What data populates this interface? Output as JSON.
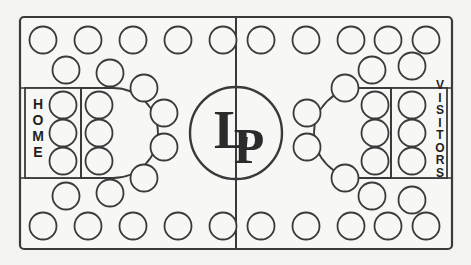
{
  "diagram": {
    "type": "rink-seating-map",
    "background_color": "#f3f3f1",
    "line_color": "#3a3a3a",
    "circle_fill": "#f7f7f5"
  },
  "center_logo": {
    "name": "center-ice-logo",
    "text": "LP",
    "letter_1": "L",
    "letter_2": "P",
    "radius": 46
  },
  "zones": {
    "home": {
      "label": "HOME",
      "side": "left",
      "orientation": "vertical"
    },
    "visitors": {
      "label": "VISITORS",
      "side": "right",
      "orientation": "vertical"
    }
  },
  "markings": {
    "center_line_label": "center-line",
    "border_label": "rink-boundary",
    "home_box_label": "home-goal-box",
    "visitors_box_label": "visitors-goal-box",
    "home_crease_label": "home-crease-arc",
    "visitors_crease_label": "visitors-crease-arc"
  },
  "chart_data": {
    "type": "scatter",
    "xlabel": "",
    "ylabel": "",
    "xlim": [
      19,
      453
    ],
    "ylim": [
      16,
      250
    ],
    "grid": false,
    "legend": null,
    "marker_radius": 13.5,
    "series": [
      {
        "name": "top-row-circles",
        "points": [
          [
            43,
            40
          ],
          [
            88,
            40
          ],
          [
            133,
            40
          ],
          [
            178,
            40
          ],
          [
            223,
            40
          ],
          [
            261,
            40
          ],
          [
            306,
            40
          ],
          [
            351,
            40
          ],
          [
            388,
            40
          ],
          [
            426,
            40
          ]
        ]
      },
      {
        "name": "second-row-circles",
        "points": [
          [
            66,
            70
          ],
          [
            110,
            73
          ],
          [
            144,
            88
          ],
          [
            372,
            70
          ],
          [
            412,
            66
          ],
          [
            345,
            88
          ]
        ]
      },
      {
        "name": "home-goal-box-circles",
        "points": [
          [
            63,
            105
          ],
          [
            63,
            133
          ],
          [
            63,
            161
          ]
        ]
      },
      {
        "name": "home-crease-circles",
        "points": [
          [
            99,
            105
          ],
          [
            99,
            133
          ],
          [
            99,
            161
          ]
        ]
      },
      {
        "name": "left-neutral-circles",
        "points": [
          [
            164,
            113
          ],
          [
            164,
            147
          ]
        ]
      },
      {
        "name": "visitors-crease-circles",
        "points": [
          [
            375,
            105
          ],
          [
            375,
            133
          ],
          [
            375,
            161
          ]
        ]
      },
      {
        "name": "visitors-goal-box-circles",
        "points": [
          [
            412,
            105
          ],
          [
            412,
            133
          ],
          [
            412,
            161
          ]
        ]
      },
      {
        "name": "right-neutral-circles",
        "points": [
          [
            307,
            113
          ],
          [
            307,
            147
          ]
        ]
      },
      {
        "name": "second-last-row-circles",
        "points": [
          [
            66,
            196
          ],
          [
            110,
            193
          ],
          [
            144,
            178
          ],
          [
            345,
            178
          ],
          [
            372,
            196
          ],
          [
            412,
            200
          ]
        ]
      },
      {
        "name": "bottom-row-circles",
        "points": [
          [
            43,
            226
          ],
          [
            88,
            226
          ],
          [
            133,
            226
          ],
          [
            178,
            226
          ],
          [
            223,
            226
          ],
          [
            261,
            226
          ],
          [
            306,
            226
          ],
          [
            351,
            226
          ],
          [
            388,
            226
          ],
          [
            426,
            226
          ]
        ]
      }
    ]
  }
}
